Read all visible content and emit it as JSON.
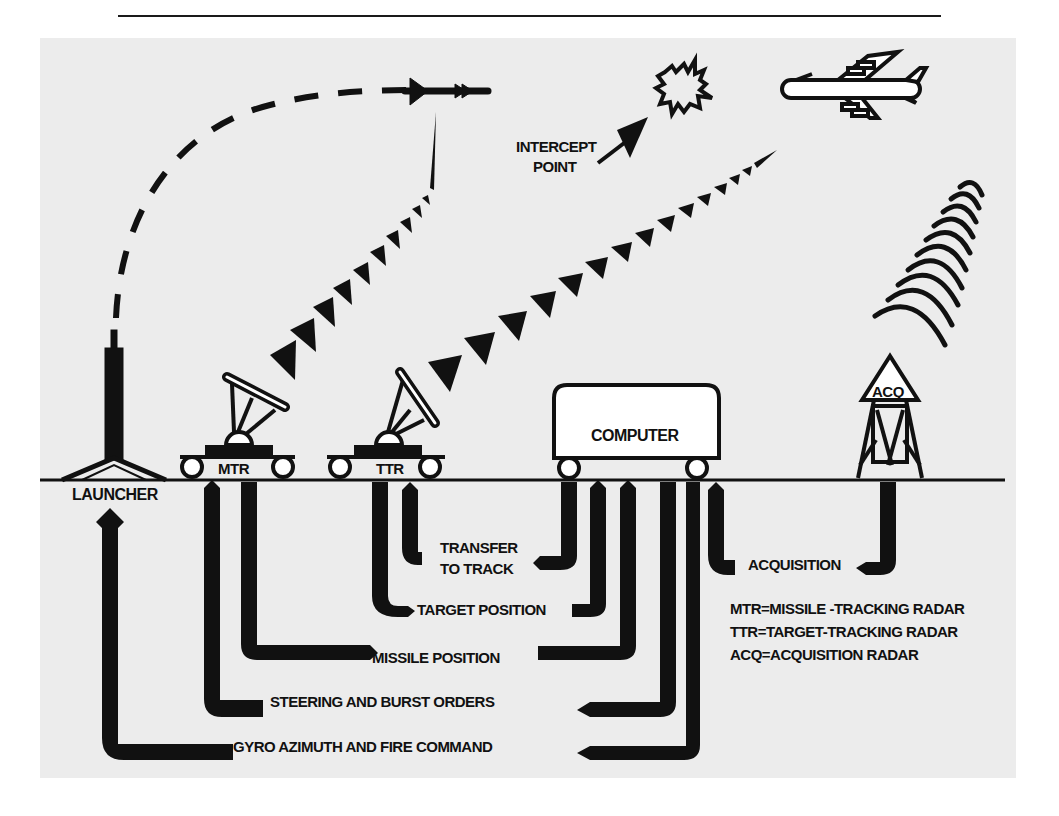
{
  "diagram": {
    "colors": {
      "ink": "#111111",
      "panel": "#ececec",
      "page": "#ffffff"
    },
    "scene_labels": {
      "intercept_line1": "INTERCEPT",
      "intercept_line2": "POINT",
      "launcher": "LAUNCHER",
      "mtr": "MTR",
      "ttr": "TTR",
      "computer": "COMPUTER",
      "acq": "ACQ"
    },
    "signal_labels": {
      "transfer_line1": "TRANSFER",
      "transfer_line2": "TO TRACK",
      "target_position": "TARGET POSITION",
      "missile_position": "MISSILE POSITION",
      "steering": "STEERING AND BURST ORDERS",
      "gyro": "GYRO AZIMUTH AND FIRE COMMAND",
      "acquisition": "ACQUISITION"
    },
    "legend": [
      {
        "abbr": "MTR",
        "text": "MTR=MISSILE -TRACKING RADAR"
      },
      {
        "abbr": "TTR",
        "text": "TTR=TARGET-TRACKING RADAR"
      },
      {
        "abbr": "ACQ",
        "text": "ACQ=ACQUISITION RADAR"
      }
    ],
    "icons": [
      "missile-icon",
      "explosion-icon",
      "bomber-aircraft-icon",
      "launcher-icon",
      "mtr-radar-icon",
      "ttr-radar-icon",
      "computer-icon",
      "acq-radar-tower-icon",
      "radar-beam-icon"
    ]
  }
}
